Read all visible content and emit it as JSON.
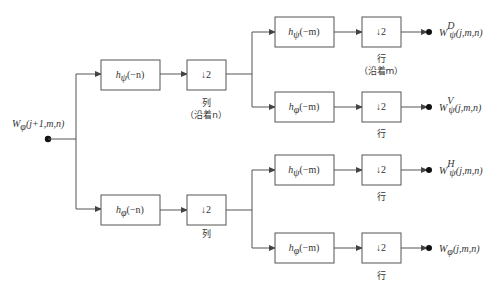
{
  "input": {
    "label_main": "W",
    "label_sub": "φ",
    "label_args": "(j+1,m,n)"
  },
  "stage1": {
    "top_filter": {
      "name": "h",
      "sub": "ψ",
      "arg": "(−n)"
    },
    "bottom_filter": {
      "name": "h",
      "sub": "φ",
      "arg": "(−n)"
    },
    "downsample": "↓2",
    "top_caption": "列",
    "top_caption2": "（沿着n）",
    "bottom_caption": "列"
  },
  "stage2": [
    {
      "filter": {
        "name": "h",
        "sub": "ψ",
        "arg": "(−m)"
      },
      "downsample": "↓2",
      "caption": "行",
      "caption2": "（沿着m）",
      "output": {
        "main": "W",
        "sub": "ψ",
        "sup": "D",
        "args": "(j,m,n)"
      }
    },
    {
      "filter": {
        "name": "h",
        "sub": "φ",
        "arg": "(−m)"
      },
      "downsample": "↓2",
      "caption": "行",
      "caption2": "",
      "output": {
        "main": "W",
        "sub": "ψ",
        "sup": "V",
        "args": "(j,m,n)"
      }
    },
    {
      "filter": {
        "name": "h",
        "sub": "ψ",
        "arg": "(−m)"
      },
      "downsample": "↓2",
      "caption": "行",
      "caption2": "",
      "output": {
        "main": "W",
        "sub": "ψ",
        "sup": "H",
        "args": "(j,m,n)"
      }
    },
    {
      "filter": {
        "name": "h",
        "sub": "φ",
        "arg": "(−m)"
      },
      "downsample": "↓2",
      "caption": "行",
      "caption2": "",
      "output": {
        "main": "W",
        "sub": "φ",
        "sup": "",
        "args": "(j,m,n)"
      }
    }
  ]
}
